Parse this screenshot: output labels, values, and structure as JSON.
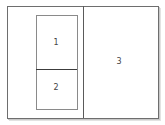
{
  "diagram": {
    "panes": [
      {
        "id": "pane-1",
        "label": "1"
      },
      {
        "id": "pane-2",
        "label": "2"
      },
      {
        "id": "pane-3",
        "label": "3"
      }
    ],
    "colors": {
      "border": "#6e6e6e",
      "divider": "#3c3c3c",
      "text": "#444444",
      "background": "#ffffff"
    }
  }
}
